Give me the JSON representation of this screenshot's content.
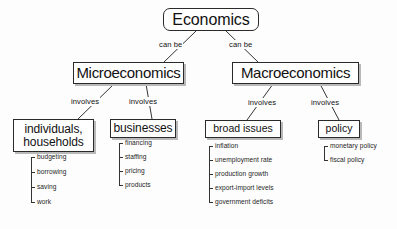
{
  "diagram": {
    "root": {
      "label": "Economics"
    },
    "branches": [
      {
        "label": "Microeconomics"
      },
      {
        "label": "Macroeconomics"
      }
    ],
    "subnodes": [
      {
        "label": "individuals,\nhouseholds",
        "line1": "individuals,",
        "line2": "households"
      },
      {
        "label": "businesses"
      },
      {
        "label": "broad issues"
      },
      {
        "label": "policy"
      }
    ],
    "edge_labels": {
      "can_be_left": "can be",
      "can_be_right": "can be",
      "involves_1": "involves",
      "involves_2": "involves",
      "involves_3": "involves",
      "involves_4": "involves"
    },
    "leaf_lists": {
      "individuals_households": [
        "budgeting",
        "borrowing",
        "saving",
        "work"
      ],
      "businesses": [
        "financing",
        "staffing",
        "pricing",
        "products"
      ],
      "broad_issues": [
        "inflation",
        "unemployment rate",
        "production growth",
        "export-import levels",
        "government deficits"
      ],
      "policy": [
        "monetary policy",
        "fiscal policy"
      ]
    },
    "colors": {
      "stroke": "#2a2a2a",
      "text": "#111111",
      "background": "#fdfdfd",
      "shadow": "#b9b9b9"
    }
  }
}
